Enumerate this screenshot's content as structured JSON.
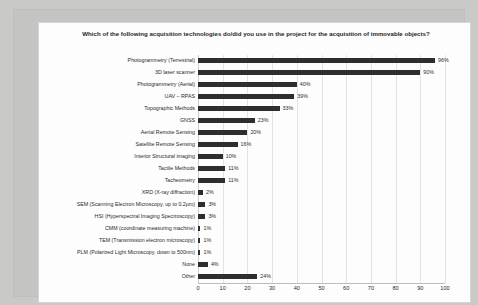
{
  "chart_data": {
    "type": "bar",
    "orientation": "horizontal",
    "title": "Which of the following acquisition technologies do/did you use in the project for the acquisition of immovable objects?",
    "xlabel": "",
    "ylabel": "",
    "xlim": [
      0,
      100
    ],
    "xticks": [
      "0",
      "10",
      "20",
      "30",
      "40",
      "50",
      "60",
      "70",
      "80",
      "90",
      "100"
    ],
    "grid": "vertical",
    "legend": "none",
    "bar_color": "#2e2e2e",
    "categories": [
      "Photogrammetry (Terrestrial)",
      "3D laser scanner",
      "Photogrammetry (Aerial)",
      "UAV – RPAS",
      "Topographic Methods",
      "GNSS",
      "Aerial Remote Sensing",
      "Satellite Remote Sensing",
      "Interior Structural imaging",
      "Tactile Methods",
      "Tacheometry",
      "XRD (X-ray diffraction)",
      "SEM (Scanning Electron Microscopy, up to 0.2µm)",
      "HSI (Hyperspectral Imaging Spectroscopy)",
      "CMM (coordinate measuring machine)",
      "TEM (Transmission electron microscopy)",
      "PLM (Polarized Light Microscopy, down to 500nm)",
      "None",
      "Other"
    ],
    "values": [
      96,
      90,
      40,
      39,
      33,
      23,
      20,
      16,
      10,
      11,
      11,
      2,
      3,
      3,
      1,
      1,
      1,
      4,
      24
    ],
    "data_labels": [
      "96%",
      "90%",
      "40%",
      "39%",
      "33%",
      "23%",
      "20%",
      "16%",
      "10%",
      "11%",
      "11%",
      "2%",
      "3%",
      "3%",
      "1%",
      "1%",
      "1%",
      "4%",
      "24%"
    ]
  }
}
